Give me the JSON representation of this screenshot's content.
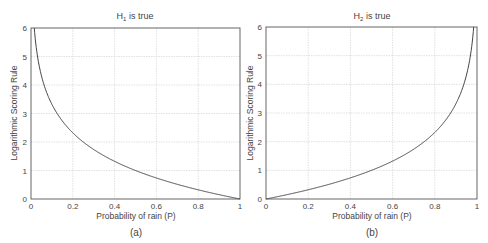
{
  "chart_data": [
    {
      "type": "line",
      "panel_label": "(a)",
      "title": "H1 is true",
      "title_main": "H",
      "title_sub": "1",
      "title_rest": " is true",
      "xlabel": "Probability of rain (P)",
      "ylabel": "Logarithmic Scoring Rule",
      "xlim": [
        0,
        1
      ],
      "ylim": [
        0,
        6
      ],
      "xticks": [
        0,
        0.2,
        0.4,
        0.6,
        0.8,
        1
      ],
      "xtick_labels": [
        "0",
        "0.2",
        "0.4",
        "0.6",
        "0.8",
        "1"
      ],
      "yticks": [
        0,
        1,
        2,
        3,
        4,
        5,
        6
      ],
      "ytick_labels": [
        "0",
        "1",
        "2",
        "3",
        "4",
        "5",
        "6"
      ],
      "grid": true,
      "function": "-log2(P)",
      "series": [
        {
          "name": "H1 is true",
          "x": [
            0.016,
            0.03,
            0.05,
            0.1,
            0.15,
            0.2,
            0.3,
            0.4,
            0.5,
            0.6,
            0.7,
            0.8,
            0.9,
            1.0
          ],
          "y": [
            6.0,
            5.06,
            4.32,
            3.32,
            2.74,
            2.32,
            1.74,
            1.32,
            1.0,
            0.74,
            0.51,
            0.32,
            0.15,
            0.0
          ]
        }
      ]
    },
    {
      "type": "line",
      "panel_label": "(b)",
      "title": "H2 is true",
      "title_main": "H",
      "title_sub": "2",
      "title_rest": " is true",
      "xlabel": "Probability of rain (P)",
      "ylabel": "Logarithmic Scoring Rule",
      "xlim": [
        0,
        1
      ],
      "ylim": [
        0,
        6
      ],
      "xticks": [
        0,
        0.2,
        0.4,
        0.6,
        0.8,
        1
      ],
      "xtick_labels": [
        "0",
        "0.2",
        "0.4",
        "0.6",
        "0.8",
        "1"
      ],
      "yticks": [
        0,
        1,
        2,
        3,
        4,
        5,
        6
      ],
      "ytick_labels": [
        "0",
        "1",
        "2",
        "3",
        "4",
        "5",
        "6"
      ],
      "grid": true,
      "function": "-log2(1-P)",
      "series": [
        {
          "name": "H2 is true",
          "x": [
            0.0,
            0.1,
            0.2,
            0.3,
            0.4,
            0.5,
            0.6,
            0.7,
            0.8,
            0.85,
            0.9,
            0.95,
            0.97,
            0.984
          ],
          "y": [
            0.0,
            0.15,
            0.32,
            0.51,
            0.74,
            1.0,
            1.32,
            1.74,
            2.32,
            2.74,
            3.32,
            4.32,
            5.06,
            6.0
          ]
        }
      ]
    }
  ],
  "colors": {
    "axis": "#555555",
    "grid": "#d4d4d4",
    "curve": "#444444",
    "text": "#444444"
  }
}
